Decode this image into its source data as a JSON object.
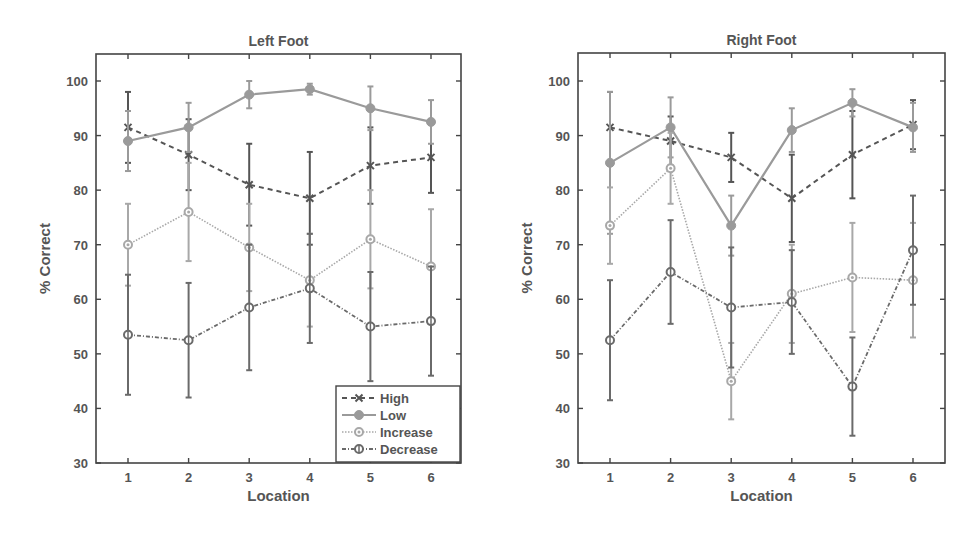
{
  "chart_data": [
    {
      "type": "line",
      "title": "Left Foot",
      "xlabel": "Location",
      "ylabel": "% Correct",
      "ylim": [
        30,
        100
      ],
      "yticks": [
        30,
        40,
        50,
        60,
        70,
        80,
        90,
        100
      ],
      "categories": [
        1,
        2,
        3,
        4,
        5,
        6
      ],
      "legend_position": "lower right",
      "series": [
        {
          "name": "High",
          "values": [
            91.5,
            86.5,
            81,
            78.5,
            84.5,
            86
          ],
          "errors": [
            6.5,
            6.5,
            7.5,
            8.5,
            7,
            6.5
          ]
        },
        {
          "name": "Low",
          "values": [
            89,
            91.5,
            97.5,
            98.5,
            95,
            92.5
          ],
          "errors": [
            5.5,
            4.5,
            2.5,
            1,
            4,
            4
          ]
        },
        {
          "name": "Increase",
          "values": [
            70,
            76,
            69.5,
            63.5,
            71,
            66
          ],
          "errors": [
            7.5,
            9,
            8,
            8.5,
            9,
            10.5
          ]
        },
        {
          "name": "Decrease",
          "values": [
            53.5,
            52.5,
            58.5,
            62,
            55,
            56
          ],
          "errors": [
            11,
            10.5,
            11.5,
            10,
            10,
            10
          ]
        }
      ]
    },
    {
      "type": "line",
      "title": "Right Foot",
      "xlabel": "Location",
      "ylabel": "% Correct",
      "ylim": [
        30,
        100
      ],
      "yticks": [
        30,
        40,
        50,
        60,
        70,
        80,
        90,
        100
      ],
      "categories": [
        1,
        2,
        3,
        4,
        5,
        6
      ],
      "series": [
        {
          "name": "High",
          "values": [
            91.5,
            89,
            86,
            78.5,
            86.5,
            92
          ],
          "errors": [
            6.5,
            4.5,
            4.5,
            8,
            8,
            4.5
          ]
        },
        {
          "name": "Low",
          "values": [
            85,
            91.5,
            73.5,
            91,
            96,
            91.5
          ],
          "errors": [
            13,
            5.5,
            5.5,
            4,
            2.5,
            4.5
          ]
        },
        {
          "name": "Increase",
          "values": [
            73.5,
            84,
            45,
            61,
            64,
            63.5
          ],
          "errors": [
            7,
            6.5,
            7,
            9,
            10,
            10.5
          ]
        },
        {
          "name": "Decrease",
          "values": [
            52.5,
            65,
            58.5,
            59.5,
            44,
            69
          ],
          "errors": [
            11,
            9.5,
            11,
            9.5,
            9,
            10
          ]
        }
      ]
    }
  ],
  "series_styles": {
    "High": {
      "color": "#555555",
      "dash": "5,4",
      "marker": "x",
      "width": 2
    },
    "Low": {
      "color": "#9a9a9a",
      "dash": "",
      "marker": "circle-filled",
      "width": 2.2
    },
    "Increase": {
      "color": "#a8a8a8",
      "dash": "1.5,1.5",
      "marker": "circle-dot",
      "width": 1.6
    },
    "Decrease": {
      "color": "#6a6a6a",
      "dash": "4,2,1,2",
      "marker": "diamond",
      "width": 1.8
    }
  }
}
